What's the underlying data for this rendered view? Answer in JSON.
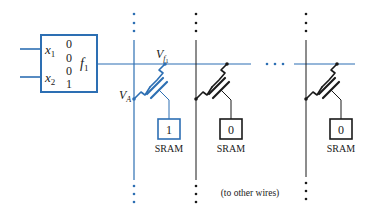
{
  "colors": {
    "blue": "#2d6fb3",
    "black": "#1a1a1a"
  },
  "lut": {
    "inputs": [
      {
        "name": "x",
        "sub": "1"
      },
      {
        "name": "x",
        "sub": "2"
      }
    ],
    "truth_values": [
      "0",
      "0",
      "0",
      "1"
    ],
    "output": {
      "name": "f",
      "sub": "1"
    }
  },
  "labels": {
    "vf1": {
      "name": "V",
      "sub": "f",
      "subsub": "1"
    },
    "va": {
      "name": "V",
      "sub": "A"
    },
    "ellipsis": "· · ·",
    "footer": "(to other wires)"
  },
  "columns": [
    {
      "sram_value": "1",
      "sram_label": "SRAM",
      "color": "blue"
    },
    {
      "sram_value": "0",
      "sram_label": "SRAM",
      "color": "black"
    },
    {
      "sram_value": "0",
      "sram_label": "SRAM",
      "color": "black"
    }
  ]
}
